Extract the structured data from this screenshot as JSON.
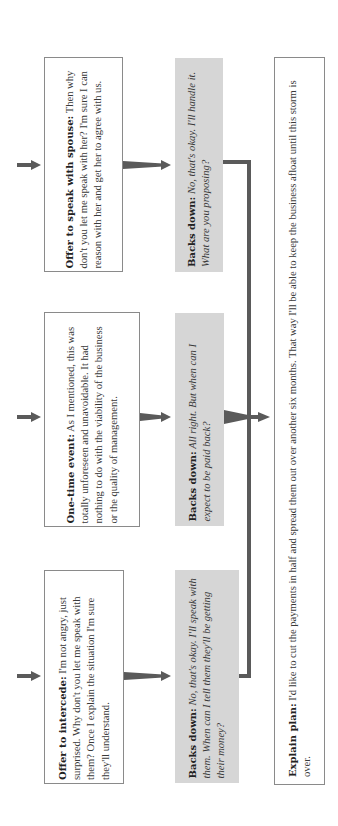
{
  "colors": {
    "box_border": "#8a8a8a",
    "grey_fill": "#d6d6d6",
    "arrow": "#5a5a5a",
    "text": "#3a3a3a"
  },
  "row1": {
    "tactic": {
      "label": "Offer to speak with spouse:",
      "text": " Then why don't you let me speak with her? I'm sure I can reason with her and get her to agree with us."
    },
    "response": {
      "label": "Backs down:",
      "text": " No, that's okay. I'll handle it. What are you proposing?"
    }
  },
  "row2": {
    "tactic": {
      "label": "One-time event:",
      "text": " As I mentioned, this was totally unforeseen and unavoidable. It had nothing to do with the viability of the business or the quality of management."
    },
    "response": {
      "label": "Backs down:",
      "text": " All right. But when can I expect to be paid back?"
    }
  },
  "row3": {
    "tactic": {
      "label": "Offer to intercede:",
      "text": " I'm not angry, just surprised. Why don't you let me speak with them? Once I explain the situation I'm sure they'll understand."
    },
    "response": {
      "label": "Backs down:",
      "text": " No, that's okay. I'll speak with them. When can I tell them they'll be getting their money?"
    }
  },
  "conclusion": {
    "label": "Explain plan:",
    "text": " I'd like to cut the payments in half and spread them out over another six months. That way I'll be able to keep the business afloat until this storm is over."
  }
}
